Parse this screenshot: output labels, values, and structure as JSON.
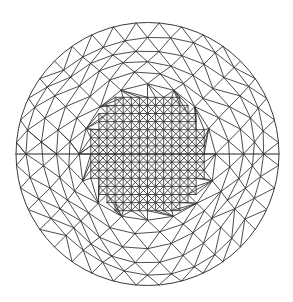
{
  "figure": {
    "title": "",
    "background_color": "#ffffff",
    "line_color": "#3a3a3a"
  },
  "mesh": {
    "domain_shape": "circle",
    "element_type": "triangle",
    "core": {
      "type": "structured-grid-with-diagonals",
      "cells_half_width": 7,
      "outline": "stepped"
    },
    "outer_rings": [
      {
        "ring": 1,
        "nodes": 16
      },
      {
        "ring": 2,
        "nodes": 20
      },
      {
        "ring": 3,
        "nodes": 24
      },
      {
        "ring": 4,
        "nodes": 28
      },
      {
        "ring": 5,
        "nodes": 32
      },
      {
        "ring": 6,
        "nodes": 36
      }
    ],
    "horizontal_diameter_line": true
  }
}
